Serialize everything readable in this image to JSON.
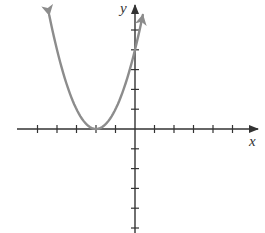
{
  "chart_data": {
    "type": "line",
    "title": "",
    "xlabel": "x",
    "ylabel": "y",
    "function": "y = (x + 2)^2",
    "xlim": [
      -5,
      6
    ],
    "ylim": [
      -5,
      5
    ],
    "x_ticks": [
      -5,
      -4,
      -3,
      -2,
      -1,
      1,
      2,
      3,
      4,
      5
    ],
    "y_ticks": [
      -5,
      -4,
      -3,
      -2,
      -1,
      1,
      2,
      3,
      4,
      5
    ],
    "tick_labels_shown": false,
    "grid": false,
    "series": [
      {
        "name": "parabola",
        "color": "#8c8c8c",
        "x": [
          -4.4,
          -4,
          -3.5,
          -3,
          -2.5,
          -2,
          -1.5,
          -1,
          -0.5,
          0,
          0.4
        ],
        "y": [
          5.76,
          4,
          2.25,
          1,
          0.25,
          0,
          0.25,
          1,
          2.25,
          4,
          5.76
        ],
        "vertex": [
          -2,
          0
        ],
        "y_intercept": [
          0,
          4
        ],
        "arrows_on_ends": true
      }
    ]
  },
  "axes": {
    "x_label": "x",
    "y_label": "y",
    "axis_color": "#333333",
    "curve_color": "#8c8c8c"
  }
}
